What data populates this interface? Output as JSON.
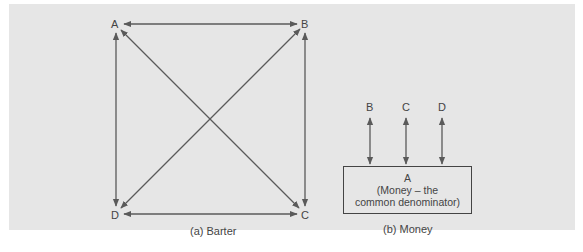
{
  "diagram": {
    "barter": {
      "nodes": [
        "A",
        "B",
        "C",
        "D"
      ],
      "caption": "(a) Barter",
      "edges": [
        [
          "A",
          "B"
        ],
        [
          "A",
          "C"
        ],
        [
          "A",
          "D"
        ],
        [
          "B",
          "C"
        ],
        [
          "B",
          "D"
        ],
        [
          "C",
          "D"
        ]
      ]
    },
    "money": {
      "nodes": [
        "B",
        "C",
        "D"
      ],
      "center": {
        "title": "A",
        "line1": "(Money – the",
        "line2": "common denominator)"
      },
      "caption": "(b) Money",
      "edges": [
        [
          "A",
          "B"
        ],
        [
          "A",
          "C"
        ],
        [
          "A",
          "D"
        ]
      ]
    },
    "colors": {
      "background": "#e6e6e6",
      "line": "#5a5a5a",
      "text": "#444444"
    }
  }
}
